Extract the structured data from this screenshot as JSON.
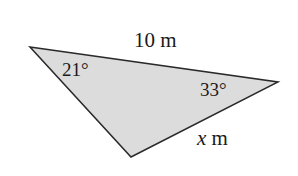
{
  "figure": {
    "kind": "geometry-diagram",
    "shape": "triangle",
    "background_color": "#ffffff",
    "fill_color": "#dcdcdc",
    "stroke_color": "#2a2a2a",
    "stroke_width": 1.5,
    "vertices": {
      "left": [
        30,
        47
      ],
      "right": [
        278,
        82
      ],
      "bottom": [
        131,
        157
      ]
    },
    "polygon_points": "30,47 278,82 131,157"
  },
  "labels": {
    "side_top": "10 m",
    "angle_left": "21°",
    "angle_right": "33°",
    "side_bottom_variable": "x",
    "side_bottom_unit": "m"
  }
}
